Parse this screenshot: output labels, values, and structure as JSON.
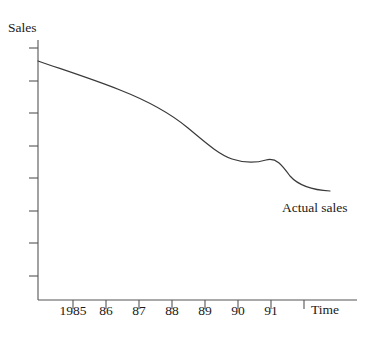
{
  "chart_data": {
    "type": "line",
    "title": "",
    "xlabel": "Time",
    "ylabel": "Sales",
    "grid": false,
    "legend_position": "inline-annotation",
    "x_tick_labels": [
      "1985",
      "86",
      "87",
      "88",
      "89",
      "90",
      "91"
    ],
    "x_tick_px": [
      73,
      106,
      139,
      172,
      205,
      238,
      271
    ],
    "x_extra_tick_px": [
      304
    ],
    "y_tick_count": 8,
    "y_axis_labeled": false,
    "annotations": [
      {
        "text": "Actual sales",
        "x_px": 282,
        "y_px": 200
      }
    ],
    "series": [
      {
        "name": "Actual sales",
        "color": "#3a3a3a",
        "description": "Sales declining steadily over time with a brief plateau near 1990 then a steeper drop",
        "categories": [
          "1985",
          "86",
          "87",
          "88",
          "89",
          "90",
          "91"
        ],
        "values": [
          88,
          79,
          70,
          61,
          50,
          42,
          40
        ],
        "ylim": [
          0,
          100
        ],
        "points_px": [
          [
            38,
            61
          ],
          [
            73,
            73
          ],
          [
            106,
            86
          ],
          [
            139,
            99
          ],
          [
            172,
            116
          ],
          [
            205,
            140
          ],
          [
            238,
            160
          ],
          [
            258,
            162
          ],
          [
            271,
            160
          ],
          [
            288,
            175
          ],
          [
            304,
            185
          ],
          [
            330,
            191
          ]
        ]
      }
    ]
  },
  "axes": {
    "y_title": "Sales",
    "x_title": "Time",
    "origin_px": [
      38,
      300
    ],
    "y_top_px": 40,
    "x_right_px": 357,
    "axis_color": "#555555"
  }
}
